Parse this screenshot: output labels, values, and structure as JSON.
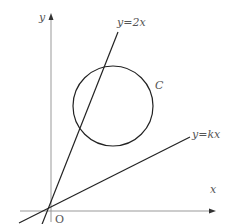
{
  "figure": {
    "axes": {
      "x_label": "x",
      "y_label": "y",
      "origin_label": "O"
    },
    "lines": [
      {
        "name": "line-y-2x",
        "label": "y=2x"
      },
      {
        "name": "line-y-kx",
        "label": "y=kx"
      }
    ],
    "circle": {
      "label": "C"
    },
    "colors": {
      "axis": "#888888",
      "curve": "#222222",
      "label": "#555555",
      "background": "#ffffff"
    }
  }
}
